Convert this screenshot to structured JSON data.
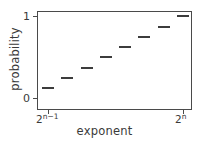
{
  "chart_data": {
    "type": "scatter",
    "title": "",
    "xlabel": "exponent",
    "ylabel": "probability",
    "grid": false,
    "legend": null,
    "ylim": [
      -0.08,
      1.1
    ],
    "yticks": [
      0,
      1
    ],
    "ytick_labels": [
      "0",
      "1"
    ],
    "xtick_labels": [
      "2^n-1",
      "2^n"
    ],
    "xtick_label_parts": [
      {
        "base": "2",
        "exponent": "n−1"
      },
      {
        "base": "2",
        "exponent": "n"
      }
    ],
    "marker_style": "horizontal-dash",
    "x": [
      1,
      2,
      3,
      4,
      5,
      6,
      7,
      8
    ],
    "values": [
      0.12,
      0.245,
      0.37,
      0.495,
      0.62,
      0.745,
      0.87,
      1.0
    ],
    "points": [
      {
        "index": 1,
        "probability": 0.12
      },
      {
        "index": 2,
        "probability": 0.245
      },
      {
        "index": 3,
        "probability": 0.37
      },
      {
        "index": 4,
        "probability": 0.495
      },
      {
        "index": 5,
        "probability": 0.62
      },
      {
        "index": 6,
        "probability": 0.745
      },
      {
        "index": 7,
        "probability": 0.87
      },
      {
        "index": 8,
        "probability": 1.0
      }
    ],
    "colors": {
      "marker": "#3c3c3c",
      "axis": "#4a4a4a",
      "text": "#3a3a3a",
      "background": "#ffffff"
    }
  },
  "axes": {
    "ylabel": "probability",
    "xlabel": "exponent",
    "ytick_low": "0",
    "ytick_high": "1"
  },
  "xticks": {
    "left_base": "2",
    "left_exp": "n−1",
    "right_base": "2",
    "right_exp": "n"
  }
}
